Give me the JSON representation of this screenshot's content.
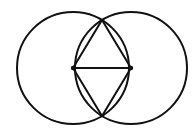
{
  "diagram": {
    "stroke_color": "#111111",
    "background_color": "#ffffff",
    "stroke_width": 2,
    "circles": [
      {
        "name": "left-circle",
        "cx": 73,
        "cy": 68,
        "r": 56
      },
      {
        "name": "right-circle",
        "cx": 131,
        "cy": 68,
        "r": 56
      }
    ],
    "points": {
      "left_center": {
        "x": 73,
        "y": 68
      },
      "right_center": {
        "x": 131,
        "y": 68
      },
      "top_intersection": {
        "x": 102,
        "y": 20
      },
      "bottom_intersection": {
        "x": 102,
        "y": 116
      }
    },
    "segments": [
      {
        "name": "top-left-edge",
        "from": "top_intersection",
        "to": "left_center"
      },
      {
        "name": "top-right-edge",
        "from": "top_intersection",
        "to": "right_center"
      },
      {
        "name": "bottom-left-edge",
        "from": "bottom_intersection",
        "to": "left_center"
      },
      {
        "name": "bottom-right-edge",
        "from": "bottom_intersection",
        "to": "right_center"
      },
      {
        "name": "center-line",
        "from": "left_center",
        "to": "right_center"
      }
    ],
    "vertex_dots": [
      "left_center",
      "right_center"
    ]
  }
}
